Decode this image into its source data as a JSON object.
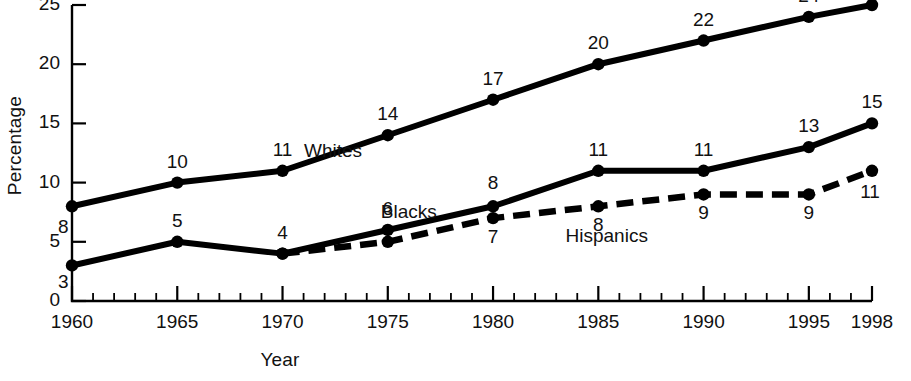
{
  "figure": {
    "background": "#ffffff",
    "ink": "#000000"
  },
  "chart_data": {
    "type": "line",
    "title": "",
    "xlabel": "Year",
    "ylabel": "Percentage",
    "x": [
      1960,
      1965,
      1970,
      1975,
      1980,
      1985,
      1990,
      1995,
      1998
    ],
    "xlim": [
      1960,
      1998
    ],
    "ylim": [
      0,
      25
    ],
    "yticks": [
      0,
      5,
      10,
      15,
      20,
      25
    ],
    "xticks": [
      1960,
      1965,
      1970,
      1975,
      1980,
      1985,
      1990,
      1995,
      1998
    ],
    "xtick_labels": [
      "1960",
      "1965",
      "1970",
      "1975",
      "1980",
      "1985",
      "1990",
      "1995",
      "1998"
    ],
    "ytick_labels": [
      "0",
      "5",
      "10",
      "15",
      "20",
      "25"
    ],
    "minor_xticks_every": 1,
    "grid": false,
    "legend": "inline-series-labels",
    "series": [
      {
        "name": "Whites",
        "style": "solid",
        "x": [
          1960,
          1965,
          1970,
          1975,
          1980,
          1985,
          1990,
          1995,
          1998
        ],
        "values": [
          8,
          10,
          11,
          14,
          17,
          20,
          22,
          24,
          25
        ],
        "point_labels": [
          "8",
          "10",
          "11",
          "14",
          "17",
          "20",
          "22",
          "24",
          "25"
        ],
        "label_note": "1998 label is clipped by the top edge of the image"
      },
      {
        "name": "Blacks",
        "style": "solid",
        "x": [
          1960,
          1965,
          1970,
          1975,
          1980,
          1985,
          1990,
          1995,
          1998
        ],
        "values": [
          3,
          5,
          4,
          6,
          8,
          11,
          11,
          13,
          15
        ],
        "point_labels": [
          "3",
          "5",
          "4",
          "6",
          "8",
          "11",
          "11",
          "13",
          "15"
        ]
      },
      {
        "name": "Hispanics",
        "style": "dashed",
        "x": [
          1970,
          1975,
          1980,
          1985,
          1990,
          1995,
          1998
        ],
        "values": [
          4,
          5,
          7,
          8,
          9,
          9,
          11
        ],
        "point_labels": [
          "",
          "",
          "7",
          "8",
          "9",
          "9",
          "11"
        ]
      }
    ],
    "annotations": [
      {
        "text": "Whites",
        "x": 1972.4,
        "y": 12.6
      },
      {
        "text": "Blacks",
        "x": 1976.0,
        "y": 7.4
      },
      {
        "text": "Hispanics",
        "x": 1985.4,
        "y": 5.4
      }
    ]
  }
}
